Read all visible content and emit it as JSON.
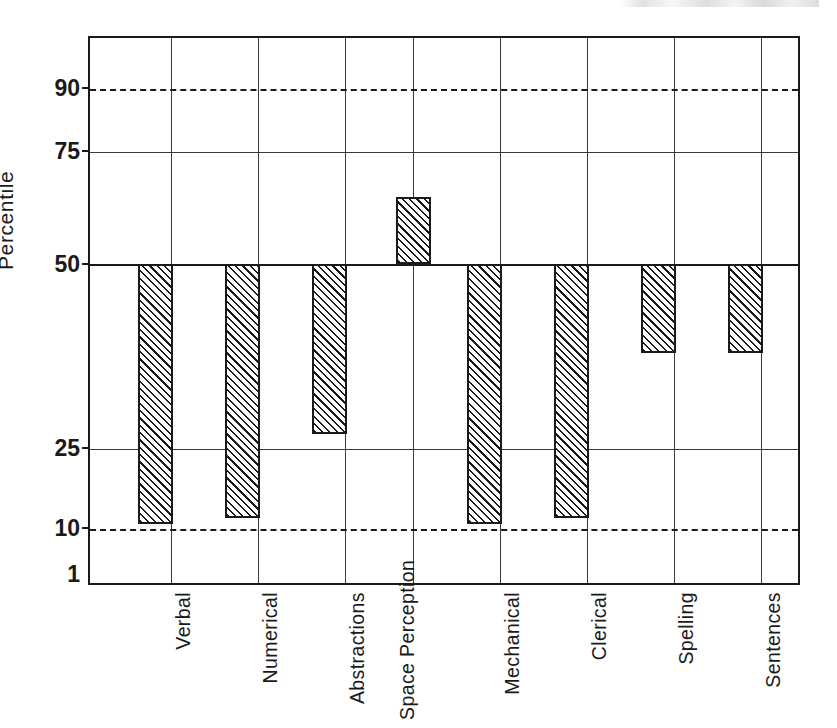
{
  "figure": {
    "alt_description": "Vertical bar chart of aptitude test percentile scores",
    "scan_artifact_label": "page-header-fragment"
  },
  "chart_data": {
    "type": "bar",
    "title": "",
    "xlabel": "",
    "ylabel": "Percentile",
    "categories": [
      "Verbal",
      "Numerical",
      "Abstractions",
      "Space Perception",
      "Mechanical",
      "Clerical",
      "Spelling",
      "Sentences"
    ],
    "values": [
      11,
      12,
      27,
      65,
      11,
      12,
      38,
      38
    ],
    "baseline": 50,
    "ylim": [
      1,
      99
    ],
    "ytick_values": [
      90,
      75,
      50,
      25,
      10,
      1
    ],
    "ytick_labels": [
      "90",
      "75",
      "50",
      "25",
      "10",
      "1"
    ],
    "gridlines": {
      "horizontal_solid": [
        75,
        50,
        25
      ],
      "horizontal_dashed": [
        90,
        10
      ],
      "vertical": true
    },
    "bar_style": {
      "fill": "diagonal-hatch",
      "hatch_angle_deg": 45,
      "edge_color": "#1a1a1a",
      "face_color": "#ffffff"
    },
    "legend": null
  }
}
